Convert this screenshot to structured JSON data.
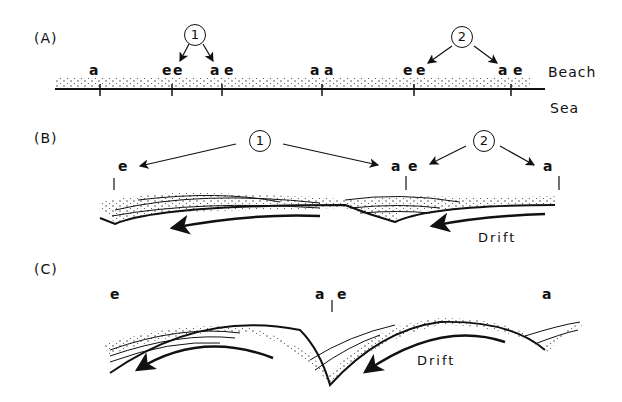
{
  "figure": {
    "panels": [
      {
        "id": "A",
        "label": "(A)",
        "callouts": [
          {
            "num": "1"
          },
          {
            "num": "2"
          }
        ],
        "markers": [
          "a",
          "e",
          "e",
          "a",
          "e",
          "a",
          "a",
          "e",
          "e",
          "a",
          "e"
        ],
        "side_labels": {
          "beach": "Beach",
          "sea": "Sea"
        }
      },
      {
        "id": "B",
        "label": "(B)",
        "callouts": [
          {
            "num": "1"
          },
          {
            "num": "2"
          }
        ],
        "markers": [
          "e",
          "a",
          "e",
          "a"
        ],
        "drift_label": "Drift"
      },
      {
        "id": "C",
        "label": "(C)",
        "markers": [
          "e",
          "a",
          "e",
          "a"
        ],
        "drift_label": "Drift"
      }
    ]
  }
}
